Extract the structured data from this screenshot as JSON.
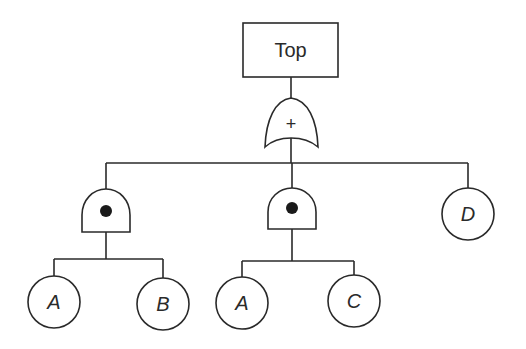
{
  "diagram": {
    "type": "fault-tree",
    "top_event": {
      "label": "Top"
    },
    "or_gate": {
      "symbol": "+",
      "name": "OR"
    },
    "branches": [
      {
        "gate": {
          "name": "AND",
          "symbol": "•"
        },
        "inputs": [
          {
            "label": "A"
          },
          {
            "label": "B"
          }
        ]
      },
      {
        "gate": {
          "name": "AND",
          "symbol": "•"
        },
        "inputs": [
          {
            "label": "A"
          },
          {
            "label": "C"
          }
        ]
      },
      {
        "event": {
          "label": "D"
        }
      }
    ],
    "colors": {
      "line": "#2a2a2a",
      "background": "#ffffff"
    }
  }
}
